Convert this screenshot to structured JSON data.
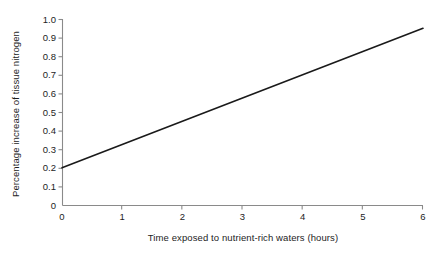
{
  "chart_data": {
    "type": "line",
    "title": "",
    "subtitle": "",
    "xlabel": "Time exposed to nutrient-rich waters (hours)",
    "ylabel": "Percentage increase of tissue nitrogen",
    "xlim": [
      0,
      6
    ],
    "ylim": [
      0,
      1.0
    ],
    "grid": false,
    "legend": false,
    "legend_position": "none",
    "xticks": [
      "0",
      "1",
      "2",
      "3",
      "4",
      "5",
      "6"
    ],
    "xtick_values": [
      0,
      1,
      2,
      3,
      4,
      5,
      6
    ],
    "yticks": [
      "0",
      "0.1",
      "0.2",
      "0.3",
      "0.4",
      "0.5",
      "0.6",
      "0.7",
      "0.8",
      "0.9",
      "1.0"
    ],
    "ytick_values": [
      0,
      0.1,
      0.2,
      0.3,
      0.4,
      0.5,
      0.6,
      0.7,
      0.8,
      0.9,
      1.0
    ],
    "series": [
      {
        "name": "tissue nitrogen increase",
        "color": "#1a1a1a",
        "x": [
          0,
          1,
          2,
          3,
          4,
          5,
          6
        ],
        "values": [
          0.2,
          0.325,
          0.45,
          0.575,
          0.7,
          0.825,
          0.95
        ]
      }
    ],
    "annotations": []
  },
  "style": {
    "background": "#ffffff",
    "axis_color": "#8a8a8a",
    "text_color": "#1d1d1d",
    "line_color": "#1a1a1a"
  }
}
